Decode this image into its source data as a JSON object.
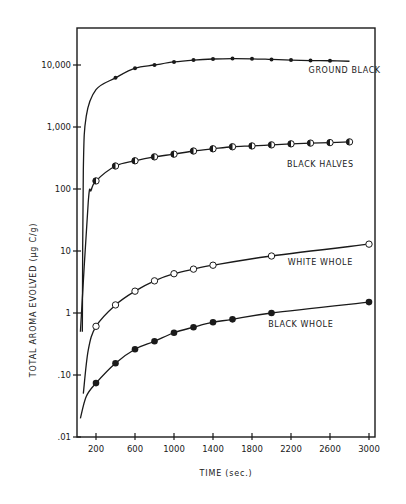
{
  "chart_data": {
    "type": "line",
    "title": "",
    "xlabel": "TIME (sec.)",
    "ylabel": "TOTAL   AROMA   EVOLVED   (µg C/g)",
    "yscale": "log",
    "xlim": [
      0,
      3000
    ],
    "ylim": [
      0.01,
      30000
    ],
    "grid": false,
    "legend_position": "inline labels",
    "x_ticks": [
      200,
      600,
      1000,
      1400,
      1800,
      2200,
      2600,
      3000
    ],
    "x_tick_labels": [
      "200",
      "600",
      "1000",
      "1400",
      "1800",
      "2200",
      "2600",
      "3000"
    ],
    "y_ticks": [
      0.01,
      0.1,
      1,
      10,
      100,
      1000,
      10000
    ],
    "y_tick_labels": [
      ".01",
      ".10",
      "1",
      "10",
      "100",
      "1,000",
      "10,000"
    ],
    "series": [
      {
        "name": "GROUND BLACK",
        "marker": "small-filled-dot",
        "x": [
          400,
          600,
          800,
          1000,
          1200,
          1400,
          1600,
          1800,
          2000,
          2200,
          2400,
          2600
        ],
        "values": [
          6200,
          8900,
          10000,
          11200,
          12000,
          12500,
          12700,
          12600,
          12300,
          12000,
          11800,
          11700
        ],
        "curve_start": [
          [
            60,
            0.5
          ],
          [
            70,
            200
          ],
          [
            100,
            1500
          ],
          [
            200,
            4000
          ]
        ],
        "curve_end": [
          2800,
          11500
        ]
      },
      {
        "name": "BLACK HALVES",
        "marker": "half-filled-circle",
        "x": [
          200,
          400,
          600,
          800,
          1000,
          1200,
          1400,
          1600,
          1800,
          2000,
          2200,
          2400,
          2600,
          2800
        ],
        "values": [
          135,
          235,
          285,
          330,
          365,
          410,
          445,
          480,
          495,
          515,
          535,
          550,
          560,
          575
        ],
        "curve_start": [
          [
            40,
            0.5
          ],
          [
            120,
            60
          ],
          [
            150,
            95
          ]
        ]
      },
      {
        "name": "WHITE WHOLE",
        "marker": "open-circle",
        "x": [
          200,
          400,
          600,
          800,
          1000,
          1200,
          1400,
          2000,
          3000
        ],
        "values": [
          0.61,
          1.35,
          2.25,
          3.3,
          4.3,
          5.1,
          5.9,
          8.3,
          12.9
        ],
        "curve_start": [
          [
            70,
            0.05
          ],
          [
            120,
            0.25
          ]
        ]
      },
      {
        "name": "BLACK WHOLE",
        "marker": "filled-circle",
        "x": [
          200,
          400,
          600,
          800,
          1000,
          1200,
          1400,
          1600,
          2000,
          3000
        ],
        "values": [
          0.074,
          0.155,
          0.26,
          0.35,
          0.48,
          0.59,
          0.71,
          0.79,
          1.0,
          1.5
        ],
        "curve_start": [
          [
            40,
            0.02
          ],
          [
            100,
            0.045
          ]
        ]
      }
    ],
    "annotations": [
      {
        "text": "GROUND BLACK",
        "x": 2750,
        "y": 7500
      },
      {
        "text": "BLACK HALVES",
        "x": 2500,
        "y": 230
      },
      {
        "text": "WHITE WHOLE",
        "x": 2500,
        "y": 6
      },
      {
        "text": "BLACK WHOLE",
        "x": 2300,
        "y": 0.6
      }
    ]
  },
  "axes": {
    "xlabel": "TIME (sec.)",
    "ylabel": "TOTAL   AROMA   EVOLVED   (µg C/g)"
  },
  "colors": {
    "ink": "#1a1a1a",
    "paper": "#ffffff"
  }
}
